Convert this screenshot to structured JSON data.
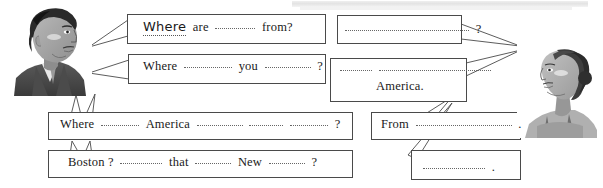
{
  "page": {
    "background_color": "#ffffff",
    "ink_color": "#4a4a4a"
  },
  "characters": [
    {
      "name": "man",
      "side": "left",
      "description": "grayscale illustration of a young man with dark hair, facing right, wearing a dark jacket and tie"
    },
    {
      "name": "woman",
      "side": "right",
      "description": "grayscale illustration of a young woman with hair tied back, facing left, wearing a sleeveless top"
    }
  ],
  "bubbles": [
    {
      "id": "left-1",
      "speaker": "man",
      "tail_direction": "left",
      "lines": [
        {
          "tokens": [
            {
              "type": "handwritten",
              "text": "Where"
            },
            {
              "type": "word",
              "text": "are"
            },
            {
              "type": "blank",
              "width": 40
            },
            {
              "type": "word",
              "text": "from?"
            }
          ]
        }
      ]
    },
    {
      "id": "left-2",
      "speaker": "man",
      "tail_direction": "left",
      "lines": [
        {
          "tokens": [
            {
              "type": "word",
              "text": "Where"
            },
            {
              "type": "blank",
              "width": 48
            },
            {
              "type": "word",
              "text": "you"
            },
            {
              "type": "blank",
              "width": 46
            },
            {
              "type": "word",
              "text": "?"
            }
          ]
        }
      ]
    },
    {
      "id": "left-3",
      "speaker": "man",
      "tail_direction": "up-left",
      "lines": [
        {
          "tokens": [
            {
              "type": "word",
              "text": "Where"
            },
            {
              "type": "blank",
              "width": 38
            },
            {
              "type": "word",
              "text": "America"
            },
            {
              "type": "blank",
              "width": 46
            },
            {
              "type": "blank",
              "width": 34
            },
            {
              "type": "blank",
              "width": 38
            },
            {
              "type": "word",
              "text": "?"
            }
          ]
        }
      ]
    },
    {
      "id": "left-4",
      "speaker": "man",
      "tail_direction": "up-left",
      "lines": [
        {
          "tokens": [
            {
              "type": "word",
              "text": "Boston ?"
            },
            {
              "type": "blank",
              "width": 42
            },
            {
              "type": "word",
              "text": "that"
            },
            {
              "type": "blank",
              "width": 36
            },
            {
              "type": "word",
              "text": "New"
            },
            {
              "type": "blank",
              "width": 36
            },
            {
              "type": "word",
              "text": "?"
            }
          ]
        }
      ]
    },
    {
      "id": "right-1",
      "speaker": "woman",
      "tail_direction": "right",
      "lines": [
        {
          "tokens": [
            {
              "type": "blank",
              "width": 124
            },
            {
              "type": "word",
              "text": "?"
            }
          ]
        }
      ]
    },
    {
      "id": "right-2",
      "speaker": "woman",
      "tail_direction": "right",
      "lines": [
        {
          "tokens": [
            {
              "type": "blank",
              "width": 32
            },
            {
              "type": "blank",
              "width": 112
            }
          ]
        },
        {
          "tokens": [
            {
              "type": "word",
              "text": "America."
            }
          ],
          "align": "center"
        }
      ]
    },
    {
      "id": "right-3",
      "speaker": "woman",
      "tail_direction": "up-right",
      "lines": [
        {
          "tokens": [
            {
              "type": "word",
              "text": "From"
            },
            {
              "type": "blank",
              "width": 96
            },
            {
              "type": "word",
              "text": "."
            }
          ]
        }
      ]
    },
    {
      "id": "right-4",
      "speaker": "woman",
      "tail_direction": "up-right",
      "lines": [
        {
          "tokens": [
            {
              "type": "blank",
              "width": 62
            },
            {
              "type": "word",
              "text": "."
            }
          ]
        }
      ]
    }
  ]
}
